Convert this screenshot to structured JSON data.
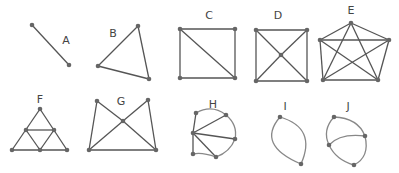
{
  "colors": {
    "edge": "#555555",
    "curve": "#888888",
    "node": "#666666",
    "label": "#444444"
  },
  "graphs": [
    {
      "id": "A",
      "label": "A",
      "label_pos": [
        66,
        44
      ],
      "nodes": [
        [
          32,
          25
        ],
        [
          69,
          65
        ]
      ],
      "edges": [
        [
          0,
          1
        ]
      ]
    },
    {
      "id": "B",
      "label": "B",
      "label_pos": [
        113,
        37
      ],
      "nodes": [
        [
          138,
          26
        ],
        [
          98,
          66
        ],
        [
          149,
          79
        ]
      ],
      "edges": [
        [
          0,
          1
        ],
        [
          1,
          2
        ],
        [
          2,
          0
        ]
      ]
    },
    {
      "id": "C",
      "label": "C",
      "label_pos": [
        209,
        19
      ],
      "nodes": [
        [
          180,
          29
        ],
        [
          235,
          29
        ],
        [
          180,
          78
        ],
        [
          235,
          78
        ]
      ],
      "edges": [
        [
          0,
          1
        ],
        [
          1,
          3
        ],
        [
          3,
          2
        ],
        [
          2,
          0
        ],
        [
          0,
          3
        ]
      ]
    },
    {
      "id": "D",
      "label": "D",
      "label_pos": [
        278,
        19
      ],
      "nodes": [
        [
          256,
          30
        ],
        [
          307,
          30
        ],
        [
          256,
          81
        ],
        [
          307,
          81
        ],
        [
          281,
          55
        ]
      ],
      "edges": [
        [
          0,
          1
        ],
        [
          1,
          3
        ],
        [
          3,
          2
        ],
        [
          2,
          0
        ],
        [
          0,
          4
        ],
        [
          4,
          3
        ],
        [
          1,
          4
        ],
        [
          4,
          2
        ]
      ]
    },
    {
      "id": "E",
      "label": "E",
      "label_pos": [
        351,
        14
      ],
      "nodes": [
        [
          351,
          23
        ],
        [
          320,
          40
        ],
        [
          389,
          40
        ],
        [
          323,
          80
        ],
        [
          378,
          80
        ]
      ],
      "edges": [
        [
          0,
          1
        ],
        [
          0,
          2
        ],
        [
          1,
          3
        ],
        [
          2,
          4
        ],
        [
          3,
          4
        ],
        [
          1,
          2
        ],
        [
          0,
          3
        ],
        [
          0,
          4
        ],
        [
          1,
          4
        ],
        [
          2,
          3
        ]
      ]
    },
    {
      "id": "F",
      "label": "F",
      "label_pos": [
        40,
        103
      ],
      "nodes": [
        [
          40,
          109
        ],
        [
          26,
          130
        ],
        [
          54,
          130
        ],
        [
          12,
          150
        ],
        [
          40,
          150
        ],
        [
          67,
          150
        ]
      ],
      "edges": [
        [
          0,
          3
        ],
        [
          0,
          5
        ],
        [
          3,
          5
        ],
        [
          1,
          2
        ],
        [
          1,
          4
        ],
        [
          2,
          4
        ]
      ]
    },
    {
      "id": "G",
      "label": "G",
      "label_pos": [
        121,
        105
      ],
      "nodes": [
        [
          97,
          101
        ],
        [
          148,
          100
        ],
        [
          123,
          121
        ],
        [
          89,
          150
        ],
        [
          156,
          150
        ]
      ],
      "edges": [
        [
          0,
          3
        ],
        [
          1,
          4
        ],
        [
          3,
          4
        ],
        [
          0,
          2
        ],
        [
          2,
          4
        ],
        [
          1,
          2
        ],
        [
          2,
          3
        ]
      ]
    },
    {
      "id": "H",
      "label": "H",
      "label_pos": [
        213,
        108
      ],
      "nodes": [
        [
          196,
          113
        ],
        [
          226,
          115
        ],
        [
          235,
          139
        ],
        [
          193,
          133
        ],
        [
          193,
          154
        ],
        [
          216,
          157
        ]
      ],
      "edges": [
        [
          3,
          0
        ],
        [
          3,
          1
        ],
        [
          3,
          2
        ],
        [
          3,
          4
        ],
        [
          3,
          5
        ]
      ],
      "curves": [
        "M196,113 Q212,104 226,115",
        "M226,115 Q238,125 235,139",
        "M235,139 Q230,152 216,157",
        "M216,157 Q202,152 193,154"
      ]
    },
    {
      "id": "I",
      "label": "I",
      "label_pos": [
        285,
        110
      ],
      "nodes": [
        [
          280,
          117
        ],
        [
          301,
          164
        ]
      ],
      "curves": [
        "M280,117 Q256,145 301,164",
        "M280,117 Q317,128 301,164"
      ]
    },
    {
      "id": "J",
      "label": "J",
      "label_pos": [
        348,
        110
      ],
      "nodes": [
        [
          334,
          117
        ],
        [
          365,
          136
        ],
        [
          329,
          145
        ],
        [
          354,
          165
        ]
      ],
      "curves": [
        "M334,117 Q358,118 365,136",
        "M365,136 Q370,157 354,165",
        "M334,117 Q322,130 329,145",
        "M329,145 Q336,160 354,165",
        "M329,145 Q340,133 365,136"
      ]
    }
  ]
}
